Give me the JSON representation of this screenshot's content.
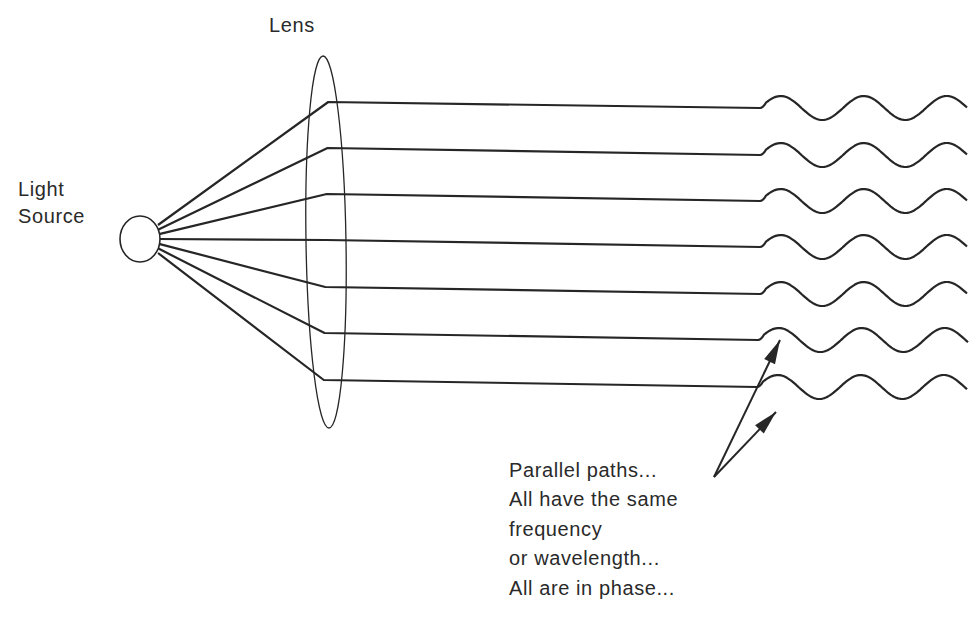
{
  "diagram": {
    "labels": {
      "lens": "Lens",
      "light_source": [
        "Light",
        "Source"
      ]
    },
    "annotation": {
      "lines": [
        "Parallel paths...",
        "All have the same",
        "frequency",
        "or wavelength...",
        "All are in phase..."
      ]
    },
    "colors": {
      "background": "#ffffff",
      "ink": "#262626"
    },
    "geometry": {
      "source": {
        "cx": 140,
        "cy": 239,
        "rx": 20,
        "ry": 23
      },
      "lens": {
        "top": [
          329,
          56
        ],
        "bottom": [
          323,
          428
        ],
        "half_width": 20
      },
      "rays": [
        {
          "lens_y": 102,
          "wave_start_x": 760,
          "wave_y": 108
        },
        {
          "lens_y": 148,
          "wave_start_x": 760,
          "wave_y": 155
        },
        {
          "lens_y": 194,
          "wave_start_x": 760,
          "wave_y": 201
        },
        {
          "lens_y": 240,
          "wave_start_x": 760,
          "wave_y": 247
        },
        {
          "lens_y": 287,
          "wave_start_x": 760,
          "wave_y": 294
        },
        {
          "lens_y": 333,
          "wave_start_x": 758,
          "wave_y": 340
        },
        {
          "lens_y": 380,
          "wave_start_x": 757,
          "wave_y": 387
        }
      ],
      "wave": {
        "period": 83,
        "amplitude": 12,
        "end_x": 968
      },
      "arrows": [
        {
          "from": [
            714,
            477
          ],
          "to": [
            780,
            340
          ]
        },
        {
          "from": [
            714,
            477
          ],
          "to": [
            776,
            412
          ]
        }
      ]
    }
  }
}
